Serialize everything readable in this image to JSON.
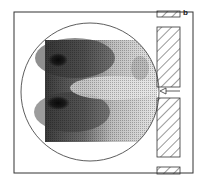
{
  "figure": {
    "panel_label": "b",
    "colors": {
      "line": "#333333",
      "dark": "#111111",
      "mid": "#777777",
      "light": "#d8d8d8",
      "background": "#ffffff"
    },
    "elements": {
      "frame": "outer-frame",
      "circle": "circular-boundary",
      "map": "density-map",
      "walls": [
        "hatched-block-top-small",
        "hatched-block-upper",
        "hatched-block-lower",
        "hatched-block-bottom-small"
      ],
      "arrow": "inlet-arrow-left"
    }
  }
}
